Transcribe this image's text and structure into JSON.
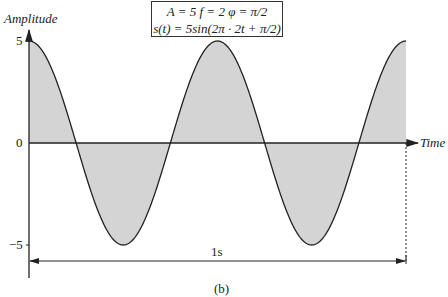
{
  "chart_data": {
    "type": "line",
    "title": "",
    "annotation_box": {
      "line1": "A = 5  f = 2  φ = π/2",
      "line2": "s(t) = 5sin(2π · 2t + π/2)"
    },
    "xlabel": "Time",
    "ylabel": "Amplitude",
    "y_ticks": [
      "5",
      "0",
      "−5"
    ],
    "ylim": [
      -5,
      5
    ],
    "xlim": [
      0,
      1
    ],
    "series": [
      {
        "name": "s(t)",
        "function": "5*sin(2*pi*2*t + pi/2)",
        "amplitude": 5,
        "frequency": 2,
        "phase": "pi/2",
        "x": [
          0,
          0.125,
          0.25,
          0.375,
          0.5,
          0.625,
          0.75,
          0.875,
          1.0
        ],
        "values": [
          5,
          0,
          -5,
          0,
          5,
          0,
          -5,
          0,
          5
        ],
        "fill": "shaded area between curve and zero line"
      }
    ],
    "duration_marker": "1s",
    "caption": "(b)",
    "grid": false,
    "legend": "none"
  },
  "colors": {
    "fill": "#d4d4d4",
    "line": "#222222"
  }
}
